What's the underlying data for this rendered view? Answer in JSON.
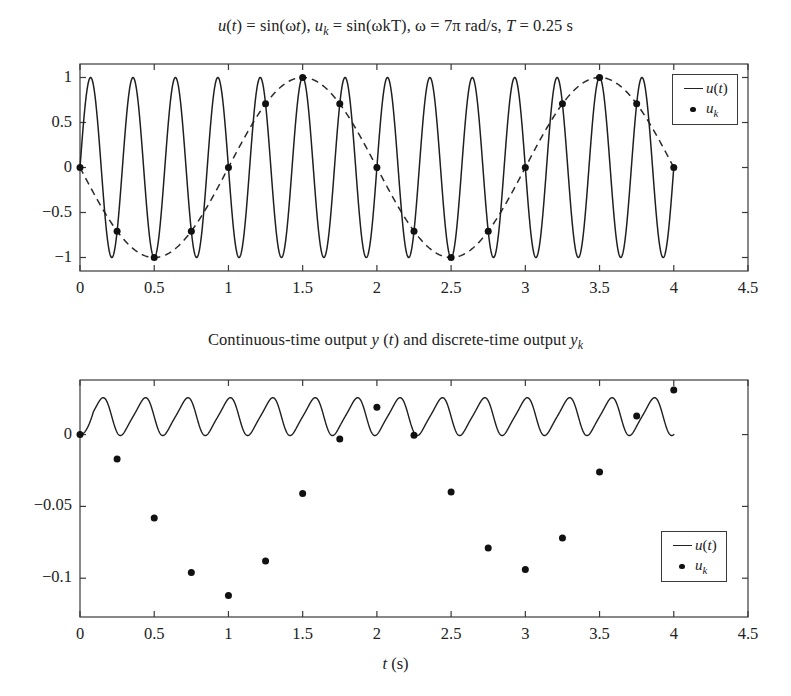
{
  "figure": {
    "plot1": {
      "title": "u(t) = sin(ωt), uₖ = sin(ωkT), ω = 7π rad/s, T = 0.25 s",
      "legend": [
        {
          "symbol": "line",
          "label": "u(t)"
        },
        {
          "symbol": "dot",
          "label": "uₖ"
        }
      ]
    },
    "plot2": {
      "title": "Continuous-time output y (t) and discrete-time output yₖ",
      "xlabel": "t (s)",
      "legend": [
        {
          "symbol": "line",
          "label": "u(t)"
        },
        {
          "symbol": "dot",
          "label": "uₖ"
        }
      ]
    }
  },
  "chart_data": [
    {
      "type": "line",
      "title": "u(t) = sin(ωt), uₖ = sin(ωkT), ω = 7π rad/s, T = 0.25 s",
      "xlabel": "",
      "ylabel": "",
      "xlim": [
        0,
        4.5
      ],
      "ylim": [
        -1.15,
        1.15
      ],
      "xticks": [
        0,
        0.5,
        1,
        1.5,
        2,
        2.5,
        3,
        3.5,
        4,
        4.5
      ],
      "xticklabels": [
        "0",
        "0.5",
        "1",
        "1.5",
        "2",
        "2.5",
        "3",
        "3.5",
        "4",
        "4.5"
      ],
      "yticks": [
        -1,
        -0.5,
        0,
        0.5,
        1
      ],
      "yticklabels": [
        "-1",
        "-0.5",
        "0",
        "0.5",
        "1"
      ],
      "grid": false,
      "legend_position": "upper right",
      "series": [
        {
          "name": "u(t)",
          "style": "solid",
          "formula": "sin(7*pi*t)",
          "t_start": 0,
          "t_end": 4,
          "amplitude": 1,
          "frequency_hz": 3.5
        },
        {
          "name": "alias envelope",
          "style": "dashed",
          "formula": "-sin(pi*t)",
          "t_start": 0,
          "t_end": 4,
          "amplitude": 1,
          "frequency_hz": 0.5
        },
        {
          "name": "uₖ",
          "style": "markers",
          "sample_period": 0.25,
          "x": [
            0,
            0.25,
            0.5,
            0.75,
            1,
            1.25,
            1.5,
            1.75,
            2,
            2.25,
            2.5,
            2.75,
            3,
            3.25,
            3.5,
            3.75,
            4
          ],
          "y": [
            0,
            -0.707,
            -1,
            -0.707,
            0,
            0.707,
            1,
            0.707,
            0,
            -0.707,
            -1,
            -0.707,
            0,
            0.707,
            1,
            0.707,
            0
          ]
        }
      ]
    },
    {
      "type": "line",
      "title": "Continuous-time output y (t) and discrete-time output yₖ",
      "xlabel": "t (s)",
      "ylabel": "",
      "xlim": [
        0,
        4.5
      ],
      "ylim": [
        -0.127,
        0.038
      ],
      "xticks": [
        0,
        0.5,
        1,
        1.5,
        2,
        2.5,
        3,
        3.5,
        4,
        4.5
      ],
      "xticklabels": [
        "0",
        "0.5",
        "1",
        "1.5",
        "2",
        "2.5",
        "3",
        "3.5",
        "4",
        "4.5"
      ],
      "yticks": [
        -0.1,
        -0.05,
        0
      ],
      "yticklabels": [
        "-0.1",
        "-0.05",
        "0"
      ],
      "grid": false,
      "legend_position": "lower right",
      "series": [
        {
          "name": "y(t)",
          "style": "solid",
          "t_start": 0,
          "t_end": 4,
          "offset": 0.0125,
          "amplitude": 0.0125,
          "frequency_hz": 3.5
        },
        {
          "name": "yₖ",
          "style": "markers",
          "sample_period": 0.25,
          "x": [
            0,
            0.25,
            0.5,
            0.75,
            1,
            1.25,
            1.5,
            1.75,
            2,
            2.25,
            2.5,
            2.75,
            3,
            3.25,
            3.5,
            3.75,
            4
          ],
          "y": [
            0,
            -0.017,
            -0.058,
            -0.096,
            -0.112,
            -0.088,
            -0.041,
            -0.003,
            0.019,
            -0.0005,
            -0.04,
            -0.079,
            -0.094,
            -0.072,
            -0.026,
            0.013,
            0.031
          ]
        }
      ]
    }
  ]
}
